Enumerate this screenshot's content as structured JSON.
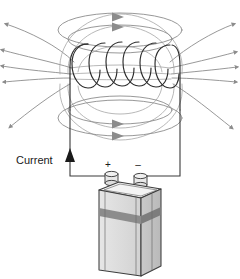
{
  "diagram": {
    "labels": {
      "current": "Current",
      "positive_terminal": "+",
      "negative_terminal": "–"
    },
    "colors": {
      "background": "#ffffff",
      "field_line": "#8c8c8c",
      "field_line_faint": "#a6a6a6",
      "coil_wire": "#2b2b2b",
      "lead_wire": "#3a3a3a",
      "current_arrow": "#1a1a1a",
      "battery_outline": "#3d3d3d",
      "battery_body": "#dcdcdc",
      "battery_top": "#f2f2f2",
      "battery_stripe": "#8a8a8a",
      "battery_side": "#c6c6c6",
      "terminal_fill": "#e8e8e8",
      "text": "#1a1a1a"
    },
    "components": {
      "coil": {
        "name": "solenoid-coil",
        "turns": 6,
        "description": "Helical wire coil wound around a vertical axis"
      },
      "battery": {
        "name": "lantern-battery",
        "terminals": 2,
        "description": "Rectangular lantern battery with two screw terminals"
      },
      "field_lines": {
        "name": "magnetic-field-lines",
        "top_loops": 2,
        "bottom_loops": 2,
        "outer_lines": 10,
        "description": "Magnetic flux lines looping from top to bottom of solenoid"
      },
      "current_indicator": {
        "name": "current-direction-arrow",
        "direction": "upward"
      }
    }
  }
}
